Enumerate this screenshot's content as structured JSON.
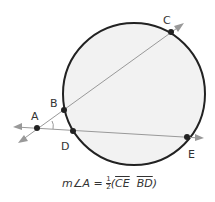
{
  "diagram": {
    "points": [
      {
        "name": "A",
        "x": 37,
        "y": 128
      },
      {
        "name": "B",
        "x": 64,
        "y": 110
      },
      {
        "name": "C",
        "x": 171,
        "y": 32
      },
      {
        "name": "D",
        "x": 73,
        "y": 131
      },
      {
        "name": "E",
        "x": 187,
        "y": 137
      }
    ],
    "labels": {
      "A": "A",
      "B": "B",
      "C": "C",
      "D": "D",
      "E": "E"
    },
    "circle": {
      "cx": 134,
      "cy": 94,
      "r": 71,
      "fill": "#f2f2f2",
      "stroke": "#222222"
    },
    "line_color": "#999999"
  },
  "formula": {
    "prefix": "m∠A = ",
    "frac_num": "1",
    "frac_den": "2",
    "open": "(",
    "arc1": "CE",
    "separator": "  ",
    "arc2": "BD",
    "close": ")"
  }
}
